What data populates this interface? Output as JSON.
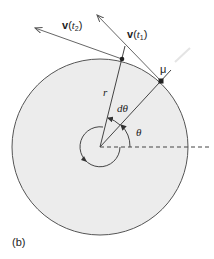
{
  "figure": {
    "panel_label": "(b)",
    "colors": {
      "disk_fill": "#ececec",
      "stroke": "#555555",
      "dark": "#222222"
    },
    "labels": {
      "v_t2": {
        "vec": "v",
        "open": "(",
        "var": "t",
        "sub": "2",
        "close": ")"
      },
      "v_t1": {
        "vec": "v",
        "open": "(",
        "var": "t",
        "sub": "1",
        "close": ")"
      },
      "mu": "μ",
      "r": "r",
      "dtheta": "dθ",
      "theta": "θ"
    },
    "geometry": {
      "center": [
        100,
        147
      ],
      "radius": 88,
      "point_t2": [
        122,
        59
      ],
      "point_t1": [
        161,
        81
      ],
      "inner_circle_radius": 20
    }
  }
}
